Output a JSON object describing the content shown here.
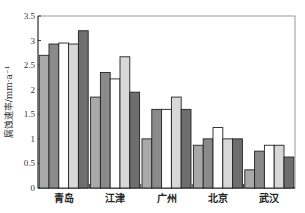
{
  "chart_data": {
    "type": "bar",
    "title": "",
    "xlabel": "",
    "ylabel": "腐蚀速率/mm·a⁻¹",
    "ylim": [
      0,
      3.5
    ],
    "yticks": [
      "0",
      "0.5",
      "1",
      "1.5",
      "2",
      "2.5",
      "3",
      "3.5"
    ],
    "grid": false,
    "legend": null,
    "categories": [
      "青岛",
      "江津",
      "广州",
      "北京",
      "武汉"
    ],
    "series": [
      {
        "name": "series-1",
        "color": "#a9a9a9",
        "values": [
          2.7,
          1.85,
          1.0,
          0.87,
          0.37
        ]
      },
      {
        "name": "series-2",
        "color": "#8a8a8a",
        "values": [
          2.93,
          2.35,
          1.6,
          1.0,
          0.75
        ]
      },
      {
        "name": "series-3",
        "color": "#ffffff",
        "values": [
          2.95,
          2.22,
          1.6,
          1.23,
          0.87
        ]
      },
      {
        "name": "series-4",
        "color": "#d8d8d8",
        "values": [
          2.93,
          2.67,
          1.85,
          1.0,
          0.87
        ]
      },
      {
        "name": "series-5",
        "color": "#6e6e6e",
        "values": [
          3.2,
          1.95,
          1.6,
          1.0,
          0.63
        ]
      }
    ]
  }
}
